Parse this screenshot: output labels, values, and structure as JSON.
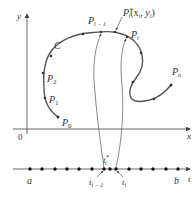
{
  "figure": {
    "xy_axes": {
      "x_label": "x",
      "y_label": "y",
      "origin_label": "0"
    },
    "curve": {
      "name": "C",
      "points": [
        {
          "label": "P",
          "sub": "0"
        },
        {
          "label": "P",
          "sub": "1"
        },
        {
          "label": "P",
          "sub": "2"
        },
        {
          "label": "P",
          "sub": "i − 1"
        },
        {
          "label": "P",
          "sub": "i"
        },
        {
          "label": "P",
          "sub": "n"
        }
      ],
      "sample_point": {
        "label": "P",
        "sub": "i",
        "sup": "*",
        "coords": "(x",
        "coords_sub1": "i",
        "coords_mid": ", y",
        "coords_sub2": "i",
        "coords_end": ")"
      }
    },
    "t_axis": {
      "axis_label": "t",
      "a_label": "a",
      "b_label": "b",
      "t_im1": {
        "label": "t",
        "sub": "i − 1"
      },
      "t_i": {
        "label": "t",
        "sub": "i"
      },
      "t_star": {
        "label": "t",
        "sub": "i",
        "sup": "*"
      }
    }
  }
}
